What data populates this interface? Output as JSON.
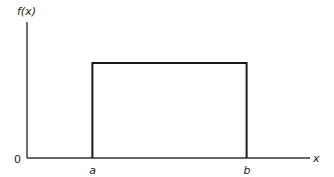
{
  "chart_data": {
    "type": "line",
    "title": "",
    "xlabel": "x",
    "ylabel": "f(x)",
    "origin_label": "0",
    "x_tick_labels": [
      "a",
      "b"
    ],
    "x_ticks": [
      1.0,
      3.36
    ],
    "xlim": [
      0,
      4.33
    ],
    "ylim": [
      0,
      1.43
    ],
    "series": [
      {
        "name": "f(x)",
        "x": [
          1.0,
          1.0,
          3.36,
          3.36
        ],
        "y": [
          0,
          1.0,
          1.0,
          0
        ]
      }
    ],
    "grid": false,
    "legend": "none"
  }
}
